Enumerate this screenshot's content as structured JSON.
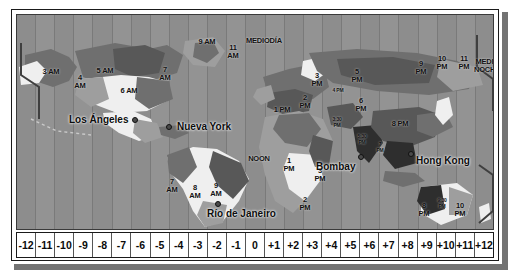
{
  "map": {
    "title": "Mapa de husos horarios del mundo",
    "cities": [
      {
        "name": "Los Ángeles",
        "x": 52,
        "y": 105,
        "dot_x": 118,
        "dot_y": 105
      },
      {
        "name": "Nueva York",
        "x": 160,
        "y": 112,
        "dot_x": 152,
        "dot_y": 112
      },
      {
        "name": "Río de Janeiro",
        "x": 190,
        "y": 199,
        "dot_x": 201,
        "dot_y": 189
      },
      {
        "name": "Bombay",
        "x": 299,
        "y": 152,
        "dot_x": 344,
        "dot_y": 142
      },
      {
        "name": "Hong Kong",
        "x": 399,
        "y": 146,
        "dot_x": 394,
        "dot_y": 139
      }
    ],
    "time_labels": [
      {
        "text": "3 AM",
        "x": 34,
        "y": 58,
        "size": "big"
      },
      {
        "text": "4\nAM",
        "x": 63,
        "y": 64,
        "size": "big"
      },
      {
        "text": "5 AM",
        "x": 88,
        "y": 57,
        "size": "big"
      },
      {
        "text": "6 AM",
        "x": 112,
        "y": 77,
        "size": "big"
      },
      {
        "text": "7\nAM",
        "x": 148,
        "y": 56,
        "size": "big"
      },
      {
        "text": "9 AM",
        "x": 190,
        "y": 28,
        "size": "big"
      },
      {
        "text": "11\nAM",
        "x": 216,
        "y": 34,
        "size": "big"
      },
      {
        "text": "MEDIODÍA",
        "x": 243,
        "y": 27,
        "size": "big"
      },
      {
        "text": "7\nAM",
        "x": 155,
        "y": 168,
        "size": "big"
      },
      {
        "text": "8\nAM",
        "x": 178,
        "y": 174,
        "size": "big"
      },
      {
        "text": "9\nAM",
        "x": 199,
        "y": 172,
        "size": "big"
      },
      {
        "text": "NOON",
        "x": 242,
        "y": 145,
        "size": "big"
      },
      {
        "text": "1\nPM",
        "x": 272,
        "y": 147,
        "size": "big"
      },
      {
        "text": "2\nPM",
        "x": 288,
        "y": 186,
        "size": "big"
      },
      {
        "text": "3\nPM",
        "x": 303,
        "y": 157,
        "size": "big"
      },
      {
        "text": "1 PM",
        "x": 265,
        "y": 96,
        "size": "big"
      },
      {
        "text": "2\nPM",
        "x": 288,
        "y": 84,
        "size": "big"
      },
      {
        "text": "3\nPM",
        "x": 300,
        "y": 62,
        "size": "big"
      },
      {
        "text": "4 PM",
        "x": 321,
        "y": 78,
        "size": "sm"
      },
      {
        "text": "5\nPM",
        "x": 340,
        "y": 58,
        "size": "big"
      },
      {
        "text": "6\nPM",
        "x": 344,
        "y": 87,
        "size": "big"
      },
      {
        "text": "3:30\nPM",
        "x": 320,
        "y": 107,
        "size": "sm"
      },
      {
        "text": "5:30\nPM",
        "x": 345,
        "y": 124,
        "size": "sm"
      },
      {
        "text": "7\nPM",
        "x": 363,
        "y": 132,
        "size": "sm"
      },
      {
        "text": "8 PM",
        "x": 383,
        "y": 110,
        "size": "big"
      },
      {
        "text": "9\nPM",
        "x": 404,
        "y": 50,
        "size": "big"
      },
      {
        "text": "10\nPM",
        "x": 425,
        "y": 45,
        "size": "big"
      },
      {
        "text": "11\nPM",
        "x": 447,
        "y": 45,
        "size": "big"
      },
      {
        "text": "MEDIA\nNOCHE",
        "x": 470,
        "y": 48,
        "size": "big"
      },
      {
        "text": "8\nPM",
        "x": 407,
        "y": 192,
        "size": "big"
      },
      {
        "text": "9:30\nPM",
        "x": 425,
        "y": 188,
        "size": "sm"
      },
      {
        "text": "10\nPM",
        "x": 443,
        "y": 192,
        "size": "big"
      }
    ]
  },
  "axis": {
    "label": "Desplazamiento UTC",
    "offsets": [
      "-12",
      "-11",
      "-10",
      "-9",
      "-8",
      "-7",
      "-6",
      "-5",
      "-4",
      "-3",
      "-2",
      "-1",
      "0",
      "+1",
      "+2",
      "+3",
      "+4",
      "+5",
      "+6",
      "+7",
      "+8",
      "+9",
      "+10",
      "+11",
      "+12"
    ]
  },
  "colors": {
    "ocean": "#8d8d8d",
    "frame": "#ffffff",
    "border": "#1a1a1a",
    "land_dark": "#585858",
    "land_mid": "#6f6f6f",
    "land_light": "#efefef",
    "land_pale": "#9e9e9e",
    "land_black": "#2e2e2e",
    "text": "#0d0d0d"
  }
}
